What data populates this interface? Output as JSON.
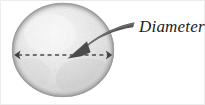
{
  "figure": {
    "kind": "diagram",
    "background_color": "#ffffff",
    "width": 205,
    "height": 105,
    "annotation": {
      "label": "Diameter",
      "style": "italic-serif",
      "color": "#1d1d1d",
      "x": 139,
      "y": 17,
      "font_size": 17
    },
    "sphere": {
      "name": "textured-sphere",
      "center_x": 63,
      "center_y": 50,
      "radius_x": 51,
      "radius_y": 47,
      "fill_light": "#f2f2f2",
      "fill_mid": "#dcdcdc",
      "fill_shadow": "#bdbdbd",
      "outline_color": "#9a9a9a"
    },
    "diameter_line": {
      "name": "dashed-diameter-line",
      "x1": 14,
      "x2": 112,
      "y": 55,
      "color": "#4a4a4a",
      "dash_pattern": "4 3",
      "stroke_width": 1.6,
      "end_caps": "arrowheads-both-ends"
    },
    "pointer_arrow": {
      "name": "curved-pointer-arrow",
      "color": "#535353",
      "tail_x": 134,
      "tail_y": 25,
      "tip_x": 68,
      "tip_y": 58,
      "description": "thick tapered curved arrow from label down-left to sphere center"
    },
    "frame": {
      "border_color": "#e4e4e4",
      "visible": true
    }
  }
}
